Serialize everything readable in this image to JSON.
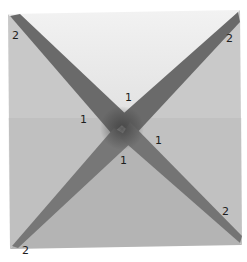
{
  "image": {
    "description": "Photograph of a square paper model with two crossing dark diagonal bands forming an X, with hand-written labels",
    "colors": {
      "background": "#ffffff",
      "top_face": "#ebebeb",
      "left_face": "#c4c4c4",
      "right_face": "#c9c9c9",
      "bottom_face": "#bdbdbd",
      "band": "#6e6e6e",
      "band_center": "#4a4a4a"
    }
  },
  "labels": {
    "corner_top_left": "2",
    "corner_top_right": "2",
    "corner_bottom_left": "2",
    "corner_bottom_right": "2",
    "center_top": "1",
    "center_left": "1",
    "center_right": "1",
    "center_bottom": "1"
  }
}
